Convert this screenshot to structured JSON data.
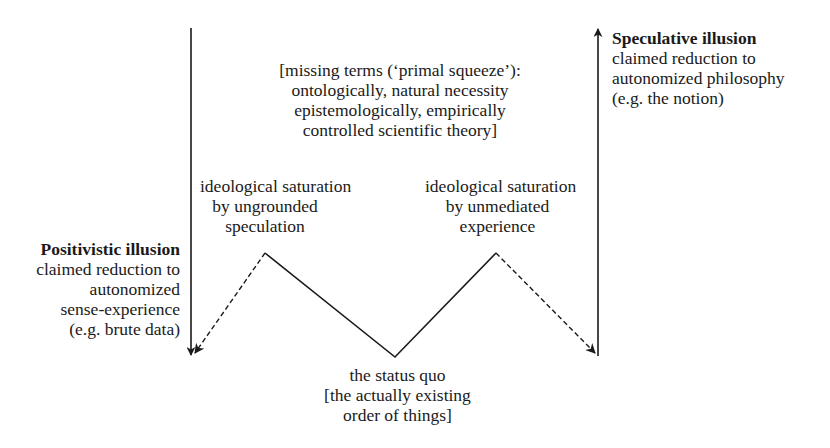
{
  "diagram": {
    "missing_terms": {
      "lines": [
        "[missing terms (‘primal squeeze’):",
        "ontologically, natural necessity",
        "epistemologically, empirically",
        "controlled scientific theory]"
      ]
    },
    "saturation_left": {
      "lines": [
        "ideological saturation",
        "by ungrounded",
        "speculation"
      ]
    },
    "saturation_right": {
      "lines": [
        "ideological saturation",
        "by unmediated",
        "experience"
      ]
    },
    "positivistic": {
      "title": "Positivistic illusion",
      "lines": [
        "claimed reduction to",
        "autonomized",
        "sense-experience",
        "(e.g. brute data)"
      ]
    },
    "speculative": {
      "title": "Speculative illusion",
      "lines": [
        "claimed reduction to",
        "autonomized philosophy",
        "(e.g. the notion)"
      ]
    },
    "status_quo": {
      "lines": [
        "the status quo",
        "[the actually existing",
        "order of things]"
      ]
    },
    "colors": {
      "line": "#1a1a1a",
      "background": "#ffffff"
    },
    "geometry": {
      "left_vertical": {
        "x": 191,
        "y_top": 28,
        "y_bottom": 356,
        "arrow": "down"
      },
      "right_vertical": {
        "x": 598,
        "y_top": 28,
        "y_bottom": 356,
        "arrow": "up"
      },
      "zigzag": [
        [
          265,
          253
        ],
        [
          395,
          357
        ],
        [
          496,
          253
        ]
      ],
      "dashed_left": {
        "from": [
          265,
          253
        ],
        "to": [
          194,
          354
        ]
      },
      "dashed_right": {
        "from": [
          496,
          253
        ],
        "to": [
          595,
          354
        ]
      }
    }
  }
}
